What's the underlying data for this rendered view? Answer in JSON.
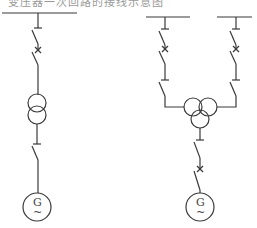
{
  "header": {
    "cut_text": "变压器一次回路的接线示意图"
  },
  "diagram": {
    "type": "single-line electrical diagram",
    "left_circuit": {
      "components": [
        "busbar",
        "disconnector",
        "circuit-breaker",
        "two-winding-transformer",
        "disconnector",
        "generator"
      ],
      "generator_label": "G",
      "generator_sub": "~"
    },
    "right_circuit": {
      "components": [
        "busbar-1",
        "busbar-2",
        "disconnector",
        "circuit-breaker",
        "disconnector",
        "three-winding-transformer",
        "disconnector",
        "circuit-breaker",
        "generator"
      ],
      "generator_label": "G",
      "generator_sub": "~"
    }
  }
}
